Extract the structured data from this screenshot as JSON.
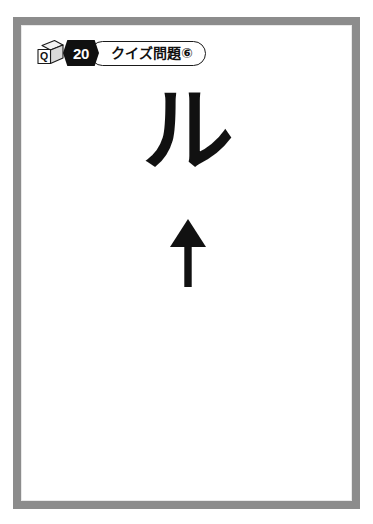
{
  "card": {
    "frame_color": "#8c8c8c",
    "background_color": "#ffffff"
  },
  "header": {
    "cube_icon_letter": "Q",
    "cube_icon_name": "q-cube-icon",
    "number_badge": "20",
    "badge_background_color": "#101010",
    "badge_text_color": "#ffffff",
    "title": "クイズ問題⑥"
  },
  "main": {
    "character": "ル",
    "character_color": "#111111",
    "arrow": {
      "direction": "up",
      "glyph": "↑",
      "color": "#111111"
    }
  }
}
